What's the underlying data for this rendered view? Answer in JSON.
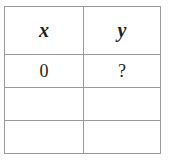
{
  "table": {
    "headers": [
      "x",
      "y"
    ],
    "rows": [
      [
        "0",
        "?"
      ],
      [
        "",
        ""
      ],
      [
        "",
        ""
      ]
    ]
  }
}
